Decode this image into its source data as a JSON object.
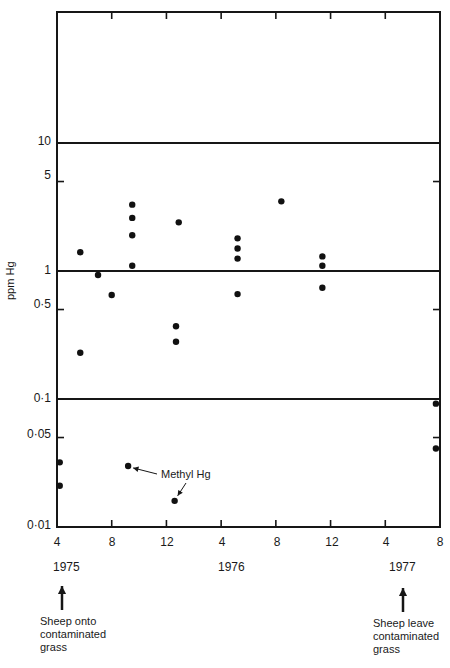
{
  "chart_data": {
    "type": "scatter",
    "title": "",
    "ylabel": "ppm Hg",
    "xlabel": "",
    "y_scale": "log",
    "ylim": [
      0.01,
      1000
    ],
    "y_ticks": [
      {
        "value": 10,
        "label": "10"
      },
      {
        "value": 5,
        "label": "5"
      },
      {
        "value": 1,
        "label": "1"
      },
      {
        "value": 0.5,
        "label": "0·5"
      },
      {
        "value": 0.1,
        "label": "0·1"
      },
      {
        "value": 0.05,
        "label": "0·05"
      },
      {
        "value": 0.01,
        "label": "0·01"
      }
    ],
    "x_ticks": [
      {
        "label": "4",
        "year": 1975,
        "month": 4
      },
      {
        "label": "8",
        "year": 1975,
        "month": 8
      },
      {
        "label": "12",
        "year": 1975,
        "month": 12
      },
      {
        "label": "4",
        "year": 1976,
        "month": 4
      },
      {
        "label": "8",
        "year": 1976,
        "month": 8
      },
      {
        "label": "12",
        "year": 1976,
        "month": 12
      },
      {
        "label": "4",
        "year": 1977,
        "month": 4
      },
      {
        "label": "8",
        "year": 1977,
        "month": 8
      }
    ],
    "year_labels": [
      {
        "label": "1975",
        "at_tick": 0
      },
      {
        "label": "1976",
        "at_tick": 3
      },
      {
        "label": "1977",
        "at_tick": 6
      }
    ],
    "reference_lines": [
      10,
      1,
      0.1
    ],
    "grid": false,
    "series": [
      {
        "name": "Total Hg",
        "points": [
          {
            "x": 5.7,
            "y": 1.4
          },
          {
            "x": 5.7,
            "y": 0.23
          },
          {
            "x": 7.0,
            "y": 0.93
          },
          {
            "x": 8.0,
            "y": 0.65
          },
          {
            "x": 9.5,
            "y": 3.3
          },
          {
            "x": 9.5,
            "y": 2.6
          },
          {
            "x": 9.5,
            "y": 1.9
          },
          {
            "x": 9.5,
            "y": 1.1
          },
          {
            "x": 12.9,
            "y": 2.4
          },
          {
            "x": 12.7,
            "y": 0.37
          },
          {
            "x": 12.7,
            "y": 0.28
          },
          {
            "x": 17.2,
            "y": 1.8
          },
          {
            "x": 17.2,
            "y": 1.5
          },
          {
            "x": 17.2,
            "y": 1.25
          },
          {
            "x": 17.2,
            "y": 0.66
          },
          {
            "x": 20.4,
            "y": 3.5
          },
          {
            "x": 23.4,
            "y": 1.3
          },
          {
            "x": 23.4,
            "y": 1.1
          },
          {
            "x": 23.4,
            "y": 0.74
          },
          {
            "x": 31.7,
            "y": 0.092
          },
          {
            "x": 31.7,
            "y": 0.041
          },
          {
            "x": 4.2,
            "y": 0.032
          },
          {
            "x": 4.2,
            "y": 0.021
          }
        ]
      },
      {
        "name": "Methyl Hg",
        "points": [
          {
            "x": 9.2,
            "y": 0.03
          },
          {
            "x": 12.6,
            "y": 0.016
          }
        ]
      }
    ],
    "x_units": "months since Jan 1975",
    "annotations": [
      {
        "text": "Methyl Hg",
        "points_to": "Methyl Hg series"
      },
      {
        "text": "Sheep onto contaminated grass",
        "arrow_at": "April 1975"
      },
      {
        "text": "Sheep leave contaminated grass",
        "arrow_at": "May 1977"
      }
    ]
  },
  "labels": {
    "ylabel": "ppm Hg",
    "methyl": "Methyl Hg",
    "y": [
      "10",
      "5",
      "1",
      "0·5",
      "0·1",
      "0·05",
      "0·01"
    ],
    "x": [
      "4",
      "8",
      "12",
      "4",
      "8",
      "12",
      "4",
      "8"
    ],
    "years": [
      "1975",
      "1976",
      "1977"
    ],
    "note_start": [
      "Sheep onto",
      "contaminated",
      "grass"
    ],
    "note_end": [
      "Sheep leave",
      "contaminated",
      "grass"
    ]
  }
}
